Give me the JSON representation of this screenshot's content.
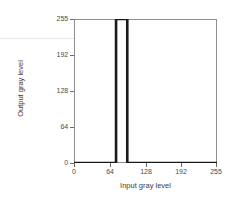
{
  "chart_data": {
    "type": "line",
    "title": "",
    "subtitle": "",
    "xlabel": "Input gray level",
    "ylabel": "Output gray level",
    "xlim": [
      0,
      255
    ],
    "ylim": [
      0,
      255
    ],
    "xticks": [
      0,
      64,
      128,
      192,
      255
    ],
    "yticks": [
      0,
      64,
      128,
      192,
      255
    ],
    "xtick_labels": [
      "0",
      "64",
      "128",
      "192",
      "255"
    ],
    "ytick_labels": [
      "0",
      "64",
      "128",
      "192",
      "255"
    ],
    "grid": false,
    "legend": null,
    "series": [
      {
        "name": "intensity slicing transform",
        "description": "Binary window transform: output is 255 only for inputs inside the slice band, 0 elsewhere.",
        "x": [
          0,
          75,
          75,
          95,
          95,
          255
        ],
        "y": [
          0,
          0,
          255,
          255,
          0,
          0
        ],
        "color": "#1a1a1a",
        "line_width": 1.6
      }
    ],
    "annotations": {
      "band_start": 75,
      "band_end": 95,
      "band_output": 255,
      "baseline_output": 0
    }
  },
  "axes": {
    "x": {
      "title": "Input gray level",
      "ticks": [
        {
          "value": 0,
          "label": "0"
        },
        {
          "value": 64,
          "label": "64"
        },
        {
          "value": 128,
          "label": "128"
        },
        {
          "value": 192,
          "label": "192"
        },
        {
          "value": 255,
          "label": "255"
        }
      ]
    },
    "y": {
      "title": "Output gray level",
      "ticks": [
        {
          "value": 0,
          "label": "0"
        },
        {
          "value": 64,
          "label": "64"
        },
        {
          "value": 128,
          "label": "128"
        },
        {
          "value": 192,
          "label": "192"
        },
        {
          "value": 255,
          "label": "255"
        }
      ]
    }
  },
  "colors": {
    "background": "#ffffff",
    "frame": "#8f8f8f",
    "curve": "#1a1a1a",
    "tick": "#6e6e6e",
    "tick_label": "#4a4a4a",
    "axis_title": "#3c3c3c",
    "artifact": "#e8e8e8"
  }
}
